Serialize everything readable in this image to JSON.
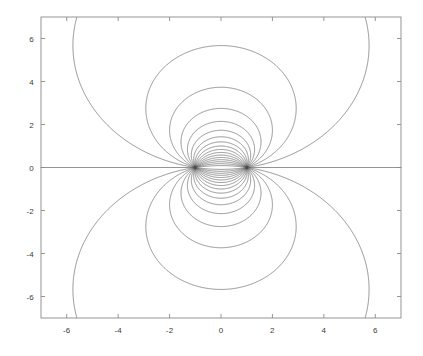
{
  "chart_data": {
    "type": "line",
    "title": "",
    "xlabel": "",
    "ylabel": "",
    "xlim": [
      -7.0,
      7.0
    ],
    "ylim": [
      -7.0,
      7.0
    ],
    "grid": false,
    "legend": null,
    "x_ticks": [
      -6,
      -4,
      -2,
      0,
      2,
      4,
      6
    ],
    "x_tick_labels": [
      "-6",
      "-4",
      "-2",
      "0",
      "2",
      "4",
      "6"
    ],
    "y_ticks": [
      -6,
      -4,
      -2,
      0,
      2,
      4,
      6
    ],
    "y_tick_labels": [
      "-6",
      "-4",
      "-2",
      "0",
      "2",
      "4",
      "6"
    ],
    "singular_points": [
      {
        "x": -1,
        "y": 0,
        "role": "sink"
      },
      {
        "x": 1,
        "y": 0,
        "role": "source"
      }
    ],
    "series": [
      {
        "name": "streamlines",
        "count": 34,
        "color": "#4d4d4d",
        "linewidth": 0.6
      }
    ],
    "axes": {
      "frame_color": "#8a8a8a",
      "background": "#ffffff",
      "tick_direction": "in"
    }
  },
  "axis": {
    "x_labels": [
      "-6",
      "-4",
      "-2",
      "0",
      "2",
      "4",
      "6"
    ],
    "y_labels": [
      "6",
      "4",
      "2",
      "0",
      "-2",
      "-4",
      "-6"
    ]
  },
  "colors": {
    "line": "#4d4d4d",
    "frame": "#8a8a8a",
    "text": "#3a3a3a",
    "background": "#ffffff"
  }
}
